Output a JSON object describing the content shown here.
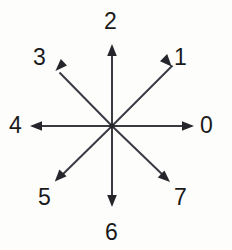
{
  "figure": {
    "type": "direction-star-diagram",
    "background_color": "#fdfdfc",
    "stroke_color": "#3a3a42",
    "label_color": "#1a1a1a",
    "center": {
      "x": 112,
      "y": 126
    },
    "arrow_count": 8
  },
  "labels": [
    {
      "id": "0",
      "text": "0",
      "direction": "east",
      "angle_deg": 0
    },
    {
      "id": "1",
      "text": "1",
      "direction": "northeast",
      "angle_deg": 45
    },
    {
      "id": "2",
      "text": "2",
      "direction": "north",
      "angle_deg": 90
    },
    {
      "id": "3",
      "text": "3",
      "direction": "northwest",
      "angle_deg": 135
    },
    {
      "id": "4",
      "text": "4",
      "direction": "west",
      "angle_deg": 180
    },
    {
      "id": "5",
      "text": "5",
      "direction": "southwest",
      "angle_deg": 225
    },
    {
      "id": "6",
      "text": "6",
      "direction": "south",
      "angle_deg": 270
    },
    {
      "id": "7",
      "text": "7",
      "direction": "southeast",
      "angle_deg": 315
    }
  ],
  "arrows": [
    {
      "id": "arrow-0",
      "label": "0",
      "tip": {
        "x": 194,
        "y": 126
      }
    },
    {
      "id": "arrow-1",
      "label": "1",
      "tip": {
        "x": 169,
        "y": 69
      }
    },
    {
      "id": "arrow-2",
      "label": "2",
      "tip": {
        "x": 112,
        "y": 44
      }
    },
    {
      "id": "arrow-3",
      "label": "3",
      "tip": {
        "x": 56,
        "y": 69
      }
    },
    {
      "id": "arrow-4",
      "label": "4",
      "tip": {
        "x": 30,
        "y": 126
      }
    },
    {
      "id": "arrow-5",
      "label": "5",
      "tip": {
        "x": 56,
        "y": 181
      }
    },
    {
      "id": "arrow-6",
      "label": "6",
      "tip": {
        "x": 112,
        "y": 207
      }
    },
    {
      "id": "arrow-7",
      "label": "7",
      "tip": {
        "x": 169,
        "y": 181
      }
    }
  ]
}
